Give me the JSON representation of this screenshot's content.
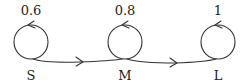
{
  "diagram": {
    "type": "state-transition",
    "stroke_color": "#333333",
    "states": [
      {
        "id": "S",
        "label": "S",
        "self_loop_prob": "0.6",
        "cx": 31,
        "cy": 42,
        "r": 17
      },
      {
        "id": "M",
        "label": "M",
        "self_loop_prob": "0.8",
        "cx": 125,
        "cy": 42,
        "r": 17
      },
      {
        "id": "L",
        "label": "L",
        "self_loop_prob": "1",
        "cx": 218,
        "cy": 42,
        "r": 17
      }
    ],
    "transitions": [
      {
        "from": "S",
        "to": "M"
      },
      {
        "from": "M",
        "to": "L"
      }
    ]
  }
}
